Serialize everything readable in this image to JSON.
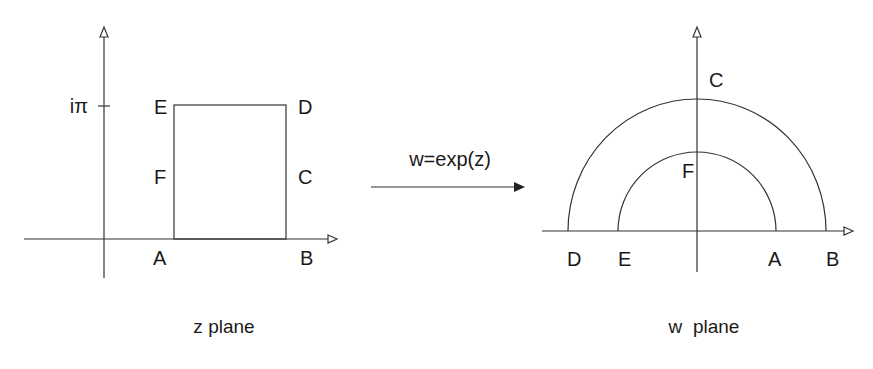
{
  "z_plane": {
    "caption": "z plane",
    "tick_label": "iπ",
    "labels": {
      "A": "A",
      "B": "B",
      "C": "C",
      "D": "D",
      "E": "E",
      "F": "F"
    }
  },
  "mapping": {
    "formula": "w=exp(z)",
    "arrow": "right-arrow"
  },
  "w_plane": {
    "caption": "w  plane",
    "labels": {
      "A": "A",
      "B": "B",
      "C": "C",
      "D": "D",
      "E": "E",
      "F": "F"
    }
  },
  "colors": {
    "line": "#333333",
    "text": "#1a1a1a",
    "background": "#ffffff"
  }
}
